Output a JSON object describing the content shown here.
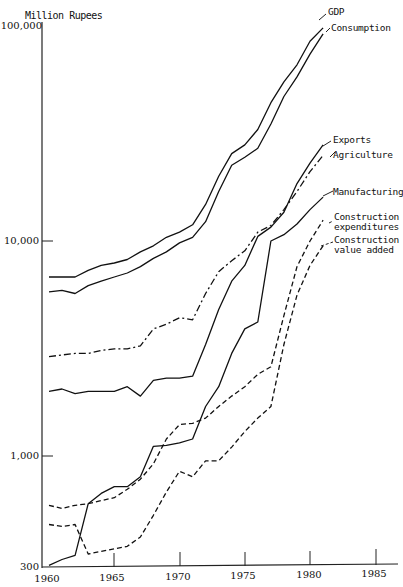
{
  "chart_data": {
    "type": "line",
    "title": "",
    "ylabel": "Million Rupees",
    "xlabel": "",
    "yscale": "log",
    "ylim": [
      300,
      100000
    ],
    "xlim": [
      1960,
      1985
    ],
    "grid": false,
    "legend_position": "inline-right",
    "y_ticks": [
      {
        "value": 100000,
        "label": "100,000"
      },
      {
        "value": 10000,
        "label": "10,000"
      },
      {
        "value": 1000,
        "label": "1,000"
      },
      {
        "value": 300,
        "label": "300"
      }
    ],
    "x_ticks": [
      {
        "value": 1960,
        "label": "1960"
      },
      {
        "value": 1965,
        "label": "1965"
      },
      {
        "value": 1970,
        "label": "1970"
      },
      {
        "value": 1975,
        "label": "1975"
      },
      {
        "value": 1980,
        "label": "1980"
      },
      {
        "value": 1985,
        "label": "1985"
      }
    ],
    "x": [
      1960,
      1961,
      1962,
      1963,
      1964,
      1965,
      1966,
      1967,
      1968,
      1969,
      1970,
      1971,
      1972,
      1973,
      1974,
      1975,
      1976,
      1977,
      1978,
      1979,
      1980,
      1981
    ],
    "series": [
      {
        "name": "GDP",
        "style": "solid",
        "values": [
          6800,
          6800,
          6800,
          7300,
          7700,
          7900,
          8200,
          8900,
          9500,
          10400,
          11000,
          11900,
          14800,
          20000,
          25500,
          28000,
          33000,
          44000,
          55000,
          66000,
          85000,
          98000
        ]
      },
      {
        "name": "Consumption",
        "style": "solid",
        "values": [
          5800,
          5900,
          5700,
          6200,
          6500,
          6800,
          7100,
          7600,
          8300,
          8900,
          9800,
          10400,
          12300,
          17000,
          22500,
          24500,
          27000,
          35000,
          47000,
          58000,
          74000,
          92000
        ]
      },
      {
        "name": "Exports",
        "style": "solid",
        "values": [
          310,
          330,
          345,
          600,
          670,
          720,
          720,
          800,
          1110,
          1120,
          1150,
          1200,
          1700,
          2100,
          3000,
          3900,
          4200,
          10000,
          10700,
          12000,
          14000,
          16000
        ]
      },
      {
        "name": "Agriculture",
        "style": "dash-dot",
        "values": [
          2900,
          2950,
          3000,
          3000,
          3100,
          3150,
          3150,
          3250,
          3900,
          4100,
          4400,
          4300,
          5700,
          7200,
          8100,
          9000,
          11000,
          11800,
          14000,
          17000,
          21000,
          25000
        ]
      },
      {
        "name": "Manufacturing",
        "style": "solid",
        "values": [
          2000,
          2050,
          1950,
          2000,
          2000,
          2000,
          2100,
          1900,
          2250,
          2300,
          2300,
          2350,
          3300,
          4800,
          6500,
          7700,
          10500,
          11600,
          13600,
          18500,
          23000,
          28000
        ]
      },
      {
        "name": "Construction expenditures",
        "style": "dashed",
        "values": [
          590,
          570,
          590,
          600,
          620,
          640,
          700,
          780,
          920,
          1200,
          1400,
          1420,
          1500,
          1700,
          1900,
          2100,
          2400,
          2600,
          4500,
          7600,
          10000,
          12500
        ]
      },
      {
        "name": "Construction value added",
        "style": "dashed",
        "values": [
          480,
          470,
          480,
          350,
          360,
          370,
          380,
          420,
          530,
          680,
          850,
          800,
          950,
          950,
          1100,
          1300,
          1500,
          1700,
          3300,
          5600,
          7700,
          9500
        ]
      }
    ],
    "annotations": []
  },
  "labels": {
    "ylabel": "Million Rupees",
    "yticks": [
      "100,000",
      "10,000",
      "1,000",
      "300"
    ],
    "xticks": [
      "1960",
      "1965",
      "1970",
      "1975",
      "1980",
      "1985"
    ],
    "legend": {
      "gdp": "GDP",
      "consumption": "Consumption",
      "exports": "Exports",
      "agriculture": "Agriculture",
      "manufacturing": "Manufacturing",
      "constr_exp_1": "Construction",
      "constr_exp_2": "expenditures",
      "constr_va_1": "Construction",
      "constr_va_2": "value added"
    }
  },
  "colors": {
    "ink": "#111111",
    "background": "#ffffff"
  }
}
